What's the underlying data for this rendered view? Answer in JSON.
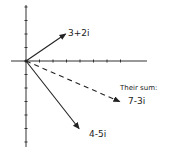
{
  "diagram": {
    "origin_px": [
      26,
      61
    ],
    "unit_px": 13.5,
    "axes": {
      "x_ticks": [
        1,
        2,
        3,
        4,
        5,
        6,
        7
      ],
      "y_ticks_up": [
        1,
        2,
        3,
        4
      ],
      "y_ticks_down": [
        -1,
        -2,
        -3,
        -4,
        -5,
        -6
      ]
    },
    "vectors": [
      {
        "id": "v1",
        "label": "3+2i",
        "re": 3,
        "im": 2,
        "style": "solid"
      },
      {
        "id": "v2",
        "label": "4-5i",
        "re": 4,
        "im": -5,
        "style": "solid"
      },
      {
        "id": "sum",
        "label": "7-3i",
        "re": 7,
        "im": -3,
        "style": "dashed"
      }
    ],
    "sum_caption": "Their sum:",
    "colors": {
      "ink": "#222222",
      "background": "#ffffff"
    }
  }
}
